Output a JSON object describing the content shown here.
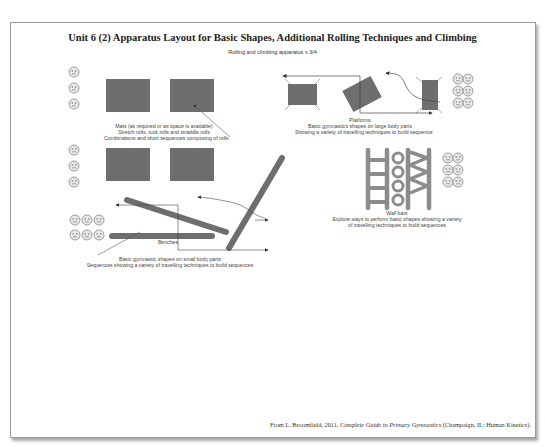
{
  "title": "Unit 6 (2) Apparatus Layout for Basic Shapes, Additional Rolling Techniques and Climbing",
  "subtitle": "Rolling and climbing apparatus x 3/4",
  "mats": {
    "line1": "Mats (as required or as space is available)",
    "line2": "Stretch rolls, tuck rolls and straddle rolls",
    "line3": "Combinations and short sequences composing of rolls"
  },
  "platforms": {
    "line1": "Platforms",
    "line2": "Basic gymnastics shapes on large body parts",
    "line3": "Showing a variety of travelling techniques to build sequence"
  },
  "benches": {
    "label": "Benches",
    "line1": "Basic gymnastic shapes on small body parts",
    "line2": "Sequences showing a variety of travelling techniques to build sequences"
  },
  "wall_bars": {
    "line1": "Wall bars",
    "line2": "Explore ways to perform basic shapes showing a variety",
    "line3": "of travelling techniques to build sequences"
  },
  "credit": {
    "prefix": "From L. Broomfield, 2011, ",
    "book": "Complete Guide to Primary Gymnastics",
    "suffix": " (Champaign, IL: Human Kinetics)."
  },
  "colors": {
    "apparatus": "#6e6e6e",
    "wall_bars": "#8c8c8c",
    "arrow": "#444444"
  }
}
